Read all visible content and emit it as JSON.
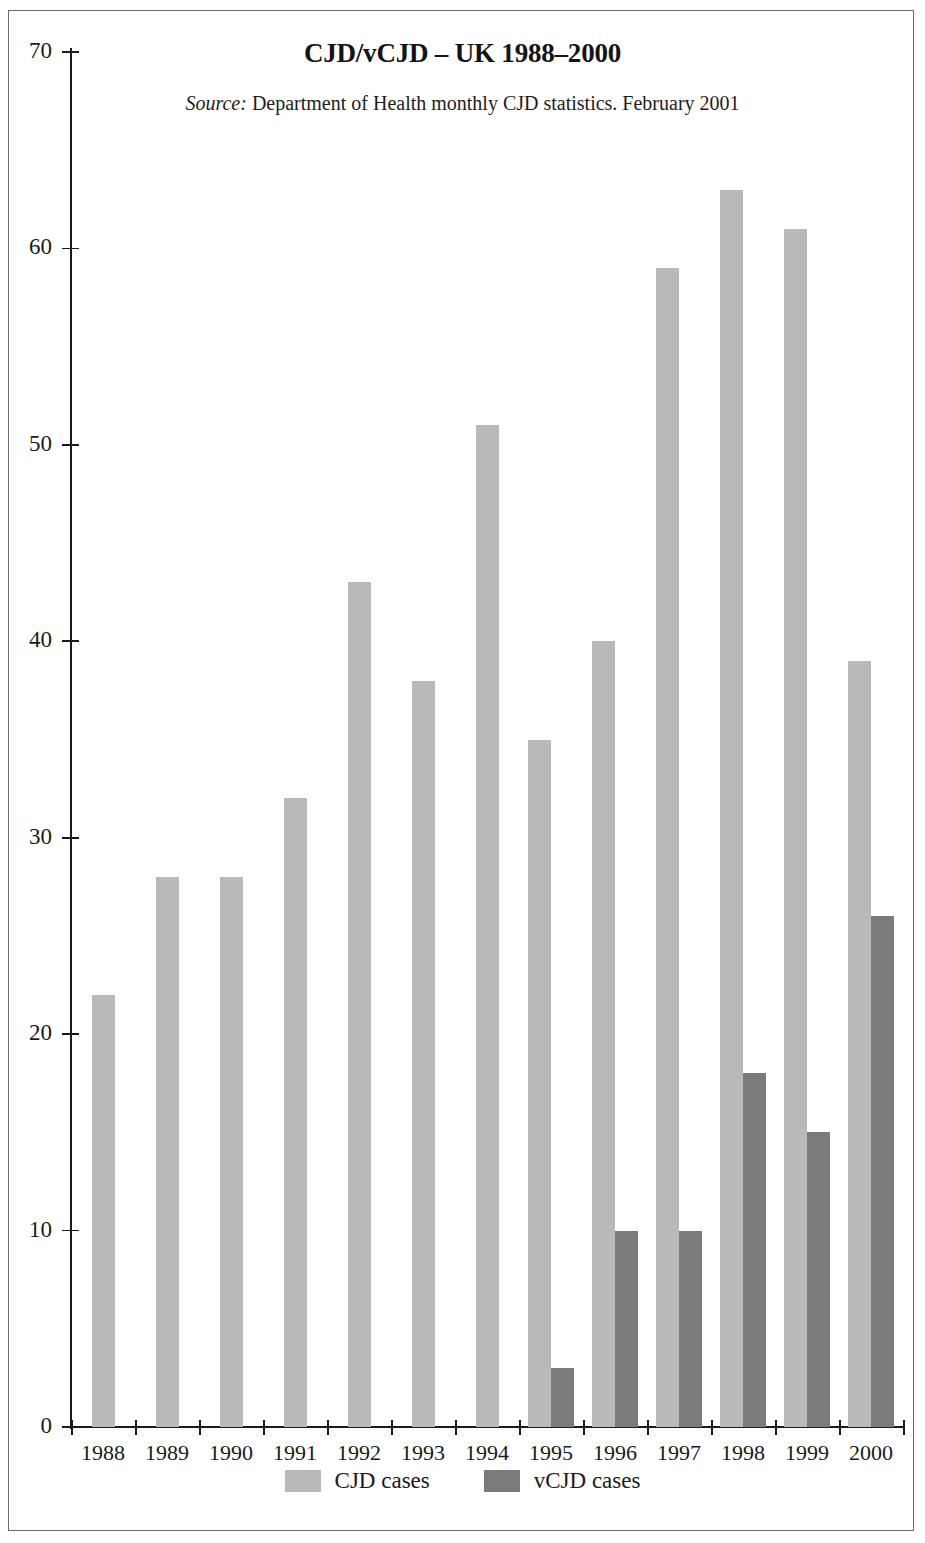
{
  "figure": {
    "title": "CJD/vCJD – UK 1988–2000",
    "source_prefix": "Source:",
    "source_text": " Department of Health monthly CJD statistics. February 2001"
  },
  "colors": {
    "cjd": "#b9b9b9",
    "vcjd": "#7b7b7b",
    "axis": "#1a1a1a",
    "frame": "#6b6b6b",
    "background": "#ffffff"
  },
  "legend": {
    "position": "bottom-center",
    "items": [
      {
        "label": "CJD cases",
        "color": "#b9b9b9"
      },
      {
        "label": "vCJD cases",
        "color": "#7b7b7b"
      }
    ]
  },
  "chart_data": {
    "type": "bar",
    "title": "CJD/vCJD – UK 1988–2000",
    "subtitle": "Source: Department of Health monthly CJD statistics. February 2001",
    "xlabel": "",
    "ylabel": "",
    "categories": [
      "1988",
      "1989",
      "1990",
      "1991",
      "1992",
      "1993",
      "1994",
      "1995",
      "1996",
      "1997",
      "1998",
      "1999",
      "2000"
    ],
    "series": [
      {
        "name": "CJD cases",
        "color": "#b9b9b9",
        "values": [
          22,
          28,
          28,
          32,
          43,
          38,
          51,
          35,
          40,
          59,
          63,
          61,
          39
        ]
      },
      {
        "name": "vCJD cases",
        "color": "#7b7b7b",
        "values": [
          0,
          0,
          0,
          0,
          0,
          0,
          0,
          3,
          10,
          10,
          18,
          15,
          26
        ]
      }
    ],
    "ylim": [
      0,
      70
    ],
    "yticks": [
      0,
      10,
      20,
      30,
      40,
      50,
      60,
      70
    ],
    "ytick_labels": [
      "0",
      "10",
      "20",
      "30",
      "40",
      "50",
      "60",
      "70"
    ],
    "grid": false
  }
}
